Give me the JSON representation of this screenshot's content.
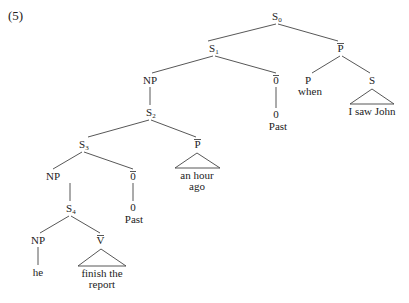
{
  "example_number": "(5)",
  "nodes": {
    "s0": {
      "label": "S",
      "sub": "0"
    },
    "s1": {
      "label": "S",
      "sub": "1"
    },
    "pbar_top": {
      "label": "P",
      "bar": true
    },
    "np1": {
      "label": "NP"
    },
    "obar1": {
      "label": "0",
      "bar": true
    },
    "p_when": {
      "label": "P"
    },
    "s_when": {
      "label": "S"
    },
    "s2": {
      "label": "S",
      "sub": "2"
    },
    "zero1": {
      "label": "0"
    },
    "s3": {
      "label": "S",
      "sub": "3"
    },
    "pbar2": {
      "label": "P",
      "bar": true
    },
    "np2": {
      "label": "NP"
    },
    "obar2": {
      "label": "0",
      "bar": true
    },
    "s4": {
      "label": "S",
      "sub": "4"
    },
    "zero2": {
      "label": "0"
    },
    "np3": {
      "label": "NP"
    },
    "vbar": {
      "label": "V",
      "bar": true
    }
  },
  "leaves": {
    "when": "when",
    "i_saw_john": "I saw John",
    "past1": "Past",
    "an_hour": "an hour",
    "ago": "ago",
    "past2": "Past",
    "he": "he",
    "finish_the": "finish the",
    "report": "report"
  }
}
